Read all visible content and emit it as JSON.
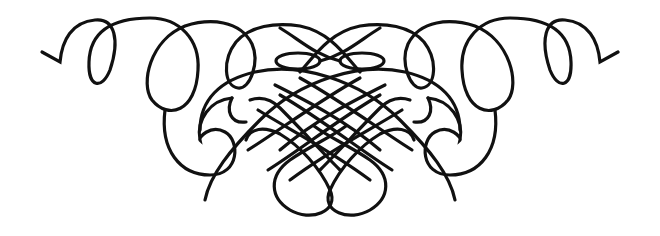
{
  "ornament": {
    "type": "calligraphic-flourish",
    "symmetry": "horizontal-mirror",
    "stroke_color": "#111111",
    "background": "#ffffff"
  }
}
